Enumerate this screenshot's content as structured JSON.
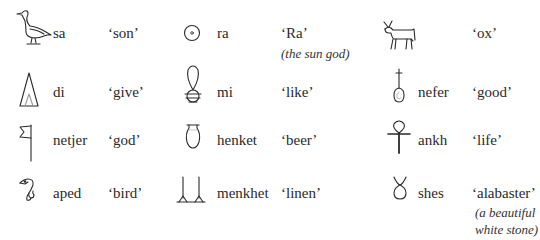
{
  "columns": [
    {
      "entries": [
        {
          "glyph": "duck-icon",
          "translit": "sa",
          "meaning": "‘son’",
          "note": ""
        },
        {
          "glyph": "cone-icon",
          "translit": "di",
          "meaning": "‘give’",
          "note": ""
        },
        {
          "glyph": "flag-icon",
          "translit": "netjer",
          "meaning": "‘god’",
          "note": ""
        },
        {
          "glyph": "bird-head-icon",
          "translit": "aped",
          "meaning": "‘bird’",
          "note": ""
        }
      ]
    },
    {
      "entries": [
        {
          "glyph": "sun-disk-icon",
          "translit": "ra",
          "meaning": "‘Ra’",
          "note": "(the sun god)"
        },
        {
          "glyph": "milk-jug-icon",
          "translit": "mi",
          "meaning": "‘like’",
          "note": ""
        },
        {
          "glyph": "beer-jar-icon",
          "translit": "henket",
          "meaning": "‘beer’",
          "note": ""
        },
        {
          "glyph": "linen-icon",
          "translit": "menkhet",
          "meaning": "‘linen’",
          "note": ""
        }
      ]
    },
    {
      "entries": [
        {
          "glyph": "ox-icon",
          "translit": "",
          "meaning": "‘ox’",
          "note": ""
        },
        {
          "glyph": "nefer-heart-windpipe-icon",
          "translit": "nefer",
          "meaning": "‘good’",
          "note": ""
        },
        {
          "glyph": "ankh-icon",
          "translit": "ankh",
          "meaning": "‘life’",
          "note": ""
        },
        {
          "glyph": "shes-knot-icon",
          "translit": "shes",
          "meaning": "‘alabaster’",
          "note_line1": "(a beautiful",
          "note_line2": "white stone)"
        }
      ]
    }
  ]
}
